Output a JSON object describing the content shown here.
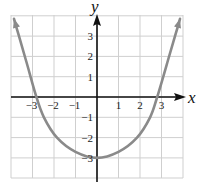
{
  "chart_data": {
    "type": "line",
    "title": "",
    "xlabel": "x",
    "ylabel": "y",
    "xlim": [
      -4,
      4
    ],
    "ylim": [
      -4,
      4
    ],
    "grid": true,
    "x_ticks": [
      -3,
      -2,
      -1,
      1,
      2,
      3
    ],
    "y_ticks": [
      3,
      2,
      1,
      -1,
      -2,
      -3
    ],
    "x_tick_labels": [
      "−3",
      "−2",
      "−1",
      "1",
      "2",
      "3"
    ],
    "y_tick_labels": [
      "3",
      "2",
      "1",
      "−1",
      "−2",
      "−3"
    ],
    "series": [
      {
        "name": "parabola",
        "color": "#8a8a8a",
        "arrows_at_ends": true,
        "x": [
          -3.86,
          -3.63,
          -3.3,
          -2.82,
          -2.47,
          -1.86,
          -1.0,
          0,
          1.0,
          1.86,
          2.47,
          2.8,
          3.3,
          3.63,
          3.86
        ],
        "y": [
          3.85,
          3.0,
          1.8,
          0,
          -1,
          -2,
          -2.7,
          -3,
          -2.7,
          -2,
          -1,
          0,
          1.8,
          3.0,
          3.85
        ]
      }
    ],
    "annotations": [
      {
        "text": "vertex",
        "x": 0,
        "y": -3,
        "visible": false
      }
    ]
  },
  "colors": {
    "grid": "#cfcfcf",
    "axis": "#111111",
    "curve": "#8a8a8a",
    "background": "#ffffff"
  }
}
